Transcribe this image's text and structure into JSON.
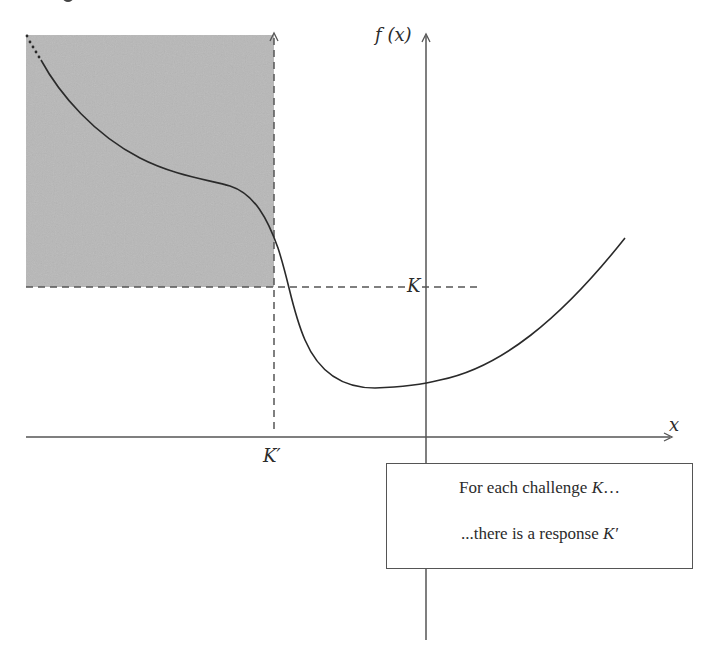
{
  "diagram": {
    "y_axis_label": "f (x)",
    "x_axis_label": "x",
    "challenge_label": "K",
    "response_label": "K′",
    "caption": {
      "line1_text": "For each challenge ",
      "line1_var": "K",
      "line1_suffix": "…",
      "line2_text": "...there is a response ",
      "line2_var": "K′"
    },
    "colors": {
      "shaded_region": "#b8b8b8",
      "axis": "#555555",
      "curve": "#2a2a2a",
      "dashed": "#555555"
    }
  }
}
